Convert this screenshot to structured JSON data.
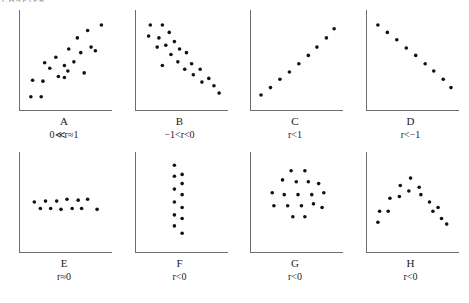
{
  "header": {
    "clipped_text": "CHAPTER"
  },
  "figure": {
    "panels": [
      {
        "id": "A",
        "letter": "A",
        "formula": "0≪r≈1",
        "pattern": "strong-positive-scatter"
      },
      {
        "id": "B",
        "letter": "B",
        "formula": "−1<r<0",
        "pattern": "moderate-negative-scatter"
      },
      {
        "id": "C",
        "letter": "C",
        "formula": "r<1",
        "pattern": "perfect-positive-line"
      },
      {
        "id": "D",
        "letter": "D",
        "formula": "r<−1",
        "pattern": "perfect-negative-line"
      },
      {
        "id": "E",
        "letter": "E",
        "formula": "r≈0",
        "pattern": "flat-horizontal-band"
      },
      {
        "id": "F",
        "letter": "F",
        "formula": "r<0",
        "pattern": "vertical-column"
      },
      {
        "id": "G",
        "letter": "G",
        "formula": "r<0",
        "pattern": "circular-cloud"
      },
      {
        "id": "H",
        "letter": "H",
        "formula": "r<0",
        "pattern": "inverted-u-arch"
      }
    ]
  },
  "chart_data": {
    "type": "scatter",
    "title": "",
    "xlabel": "",
    "ylabel": "",
    "xlim": [
      0,
      100
    ],
    "ylim": [
      0,
      100
    ],
    "grid": false,
    "legend": null,
    "panel_count": 8,
    "panels": [
      {
        "id": "A",
        "label": "A",
        "annotation": "0≪r≈1",
        "description": "Strong positive linear association with scatter",
        "points": [
          [
            8,
            10
          ],
          [
            20,
            10
          ],
          [
            10,
            28
          ],
          [
            22,
            27
          ],
          [
            30,
            41
          ],
          [
            24,
            47
          ],
          [
            37,
            53
          ],
          [
            40,
            32
          ],
          [
            47,
            44
          ],
          [
            52,
            62
          ],
          [
            51,
            38
          ],
          [
            58,
            48
          ],
          [
            62,
            74
          ],
          [
            66,
            58
          ],
          [
            70,
            36
          ],
          [
            74,
            82
          ],
          [
            78,
            64
          ],
          [
            83,
            60
          ],
          [
            90,
            88
          ],
          [
            47,
            31
          ]
        ]
      },
      {
        "id": "B",
        "label": "B",
        "annotation": "−1<r<0",
        "description": "Moderate negative linear association with scatter",
        "points": [
          [
            12,
            88
          ],
          [
            26,
            88
          ],
          [
            10,
            76
          ],
          [
            22,
            74
          ],
          [
            34,
            80
          ],
          [
            20,
            64
          ],
          [
            30,
            66
          ],
          [
            40,
            70
          ],
          [
            36,
            56
          ],
          [
            46,
            62
          ],
          [
            44,
            48
          ],
          [
            54,
            58
          ],
          [
            52,
            40
          ],
          [
            26,
            44
          ],
          [
            60,
            46
          ],
          [
            62,
            34
          ],
          [
            70,
            40
          ],
          [
            72,
            26
          ],
          [
            80,
            30
          ],
          [
            86,
            22
          ],
          [
            92,
            14
          ]
        ]
      },
      {
        "id": "C",
        "label": "C",
        "annotation": "r<1",
        "description": "Perfect positive linear relationship",
        "points": [
          [
            7,
            12
          ],
          [
            18,
            20
          ],
          [
            29,
            29
          ],
          [
            40,
            37
          ],
          [
            51,
            46
          ],
          [
            62,
            55
          ],
          [
            72,
            64
          ],
          [
            83,
            74
          ],
          [
            92,
            84
          ]
        ]
      },
      {
        "id": "D",
        "label": "D",
        "annotation": "r<−1",
        "description": "Perfect negative linear relationship",
        "points": [
          [
            8,
            88
          ],
          [
            19,
            80
          ],
          [
            30,
            72
          ],
          [
            41,
            63
          ],
          [
            52,
            55
          ],
          [
            63,
            46
          ],
          [
            73,
            38
          ],
          [
            84,
            29
          ],
          [
            93,
            20
          ]
        ]
      },
      {
        "id": "E",
        "label": "E",
        "annotation": "r≈0",
        "description": "No association, flat horizontal band of points",
        "points": [
          [
            12,
            50
          ],
          [
            25,
            51
          ],
          [
            38,
            51
          ],
          [
            50,
            53
          ],
          [
            63,
            52
          ],
          [
            74,
            53
          ],
          [
            19,
            43
          ],
          [
            31,
            43
          ],
          [
            43,
            42
          ],
          [
            56,
            43
          ],
          [
            67,
            43
          ],
          [
            85,
            42
          ]
        ]
      },
      {
        "id": "F",
        "label": "F",
        "annotation": "r<0",
        "description": "No association, vertical column of points",
        "points": [
          [
            40,
            90
          ],
          [
            40,
            78
          ],
          [
            49,
            80
          ],
          [
            49,
            70
          ],
          [
            40,
            64
          ],
          [
            49,
            58
          ],
          [
            40,
            50
          ],
          [
            49,
            44
          ],
          [
            40,
            36
          ],
          [
            49,
            32
          ],
          [
            40,
            24
          ],
          [
            49,
            16
          ]
        ]
      },
      {
        "id": "G",
        "label": "G",
        "annotation": "r<0",
        "description": "No linear association, circular ring-shaped cloud",
        "points": [
          [
            42,
            84
          ],
          [
            58,
            84
          ],
          [
            32,
            74
          ],
          [
            48,
            72
          ],
          [
            62,
            72
          ],
          [
            74,
            70
          ],
          [
            20,
            60
          ],
          [
            34,
            58
          ],
          [
            50,
            58
          ],
          [
            66,
            58
          ],
          [
            80,
            60
          ],
          [
            22,
            46
          ],
          [
            38,
            46
          ],
          [
            54,
            46
          ],
          [
            68,
            48
          ],
          [
            78,
            44
          ],
          [
            44,
            34
          ],
          [
            58,
            34
          ]
        ]
      },
      {
        "id": "H",
        "label": "H",
        "annotation": "r<0",
        "description": "Curvilinear inverted-U (parabolic) relationship",
        "points": [
          [
            8,
            28
          ],
          [
            10,
            40
          ],
          [
            20,
            40
          ],
          [
            22,
            54
          ],
          [
            33,
            56
          ],
          [
            34,
            68
          ],
          [
            44,
            62
          ],
          [
            46,
            76
          ],
          [
            56,
            66
          ],
          [
            58,
            58
          ],
          [
            68,
            50
          ],
          [
            72,
            40
          ],
          [
            78,
            44
          ],
          [
            82,
            32
          ],
          [
            88,
            26
          ]
        ]
      }
    ]
  }
}
